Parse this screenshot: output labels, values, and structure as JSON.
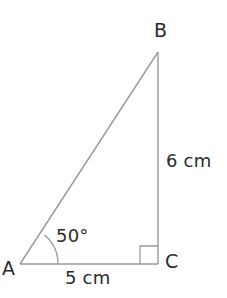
{
  "figure": {
    "type": "right-triangle-geometry-diagram",
    "background_color": "#ffffff",
    "stroke_color": "#9a9a9a",
    "text_color": "#2b2b2b",
    "vertices": {
      "A": {
        "label": "A",
        "x": 20,
        "y": 264
      },
      "B": {
        "label": "B",
        "x": 158,
        "y": 52
      },
      "C": {
        "label": "C",
        "x": 158,
        "y": 264
      }
    },
    "labels": {
      "vertex_a": "A",
      "vertex_b": "B",
      "vertex_c": "C",
      "angle_at_a": "50°",
      "side_bc": "6 cm",
      "side_ac": "5 cm"
    },
    "markers": {
      "angle_arc_at_a": {
        "radius": 38,
        "measure": "50°"
      },
      "right_angle_at_c": {
        "size": 18,
        "measure": "90°"
      }
    }
  }
}
